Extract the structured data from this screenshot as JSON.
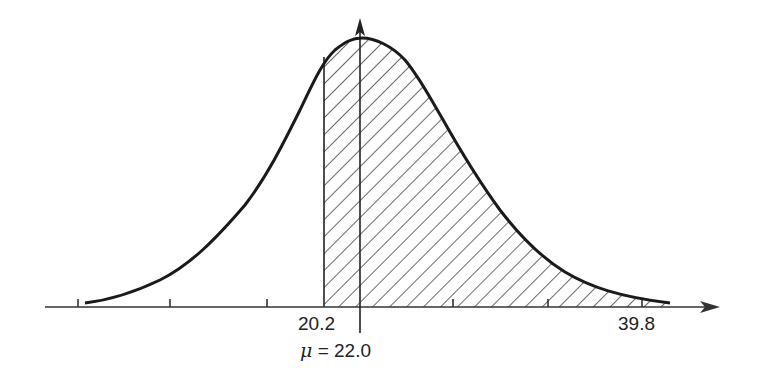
{
  "figure": {
    "type": "normal-distribution-diagram",
    "labels": {
      "lower_bound": "20.2",
      "upper_bound": "39.8",
      "mean_symbol": "μ",
      "mean_equals": " = 22.0"
    },
    "colors": {
      "curve": "#1a1a1a",
      "axis": "#333333",
      "hatch": "#444444",
      "background": "#ffffff"
    },
    "shaded_region": {
      "from": "20.2",
      "to": "39.8",
      "pattern": "diagonal-hatch"
    },
    "tick_count": 7
  }
}
